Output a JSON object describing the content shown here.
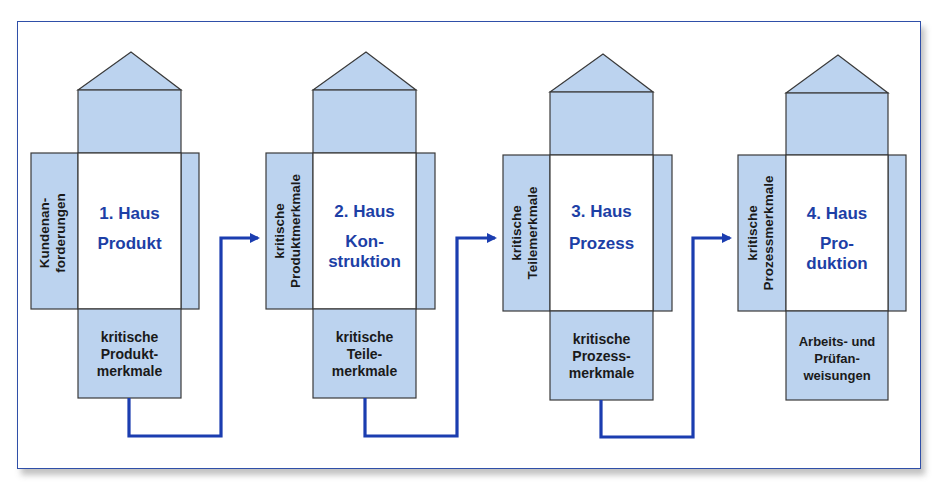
{
  "colors": {
    "house_fill": "#bcd3ef",
    "outline": "#3a3a3a",
    "arrow": "#1b3db0",
    "title_text": "#1d3fa6",
    "frame_border": "#2f4fa8"
  },
  "houses": [
    {
      "title": "1. Haus",
      "subtitle": "Produkt",
      "input_label_line1": "Kundenan-",
      "input_label_line2": "forderungen",
      "output_line1": "kritische",
      "output_line2": "Produkt-",
      "output_line3": "merkmale"
    },
    {
      "title": "2. Haus",
      "subtitle_line1": "Kon-",
      "subtitle_line2": "struktion",
      "input_label_line1": "kritische",
      "input_label_line2": "Produktmerkmale",
      "output_line1": "kritische",
      "output_line2": "Teile-",
      "output_line3": "merkmale"
    },
    {
      "title": "3. Haus",
      "subtitle": "Prozess",
      "input_label_line1": "kritische",
      "input_label_line2": "Teilemerkmale",
      "output_line1": "kritische",
      "output_line2": "Prozess-",
      "output_line3": "merkmale"
    },
    {
      "title": "4. Haus",
      "subtitle_line1": "Pro-",
      "subtitle_line2": "duktion",
      "input_label_line1": "kritische",
      "input_label_line2": "Prozessmerkmale",
      "output_line1": "Arbeits- und",
      "output_line2": "Prüfan-",
      "output_line3": "weisungen"
    }
  ]
}
